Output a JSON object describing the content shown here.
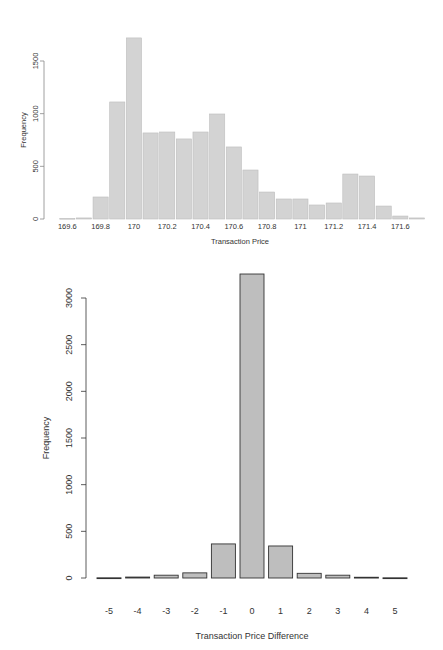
{
  "chart_data": [
    {
      "type": "bar",
      "title": "",
      "xlabel": "Transaction Price",
      "ylabel": "Frequency",
      "categories": [
        "169.6",
        "169.7",
        "169.8",
        "169.9",
        "170",
        "170.1",
        "170.2",
        "170.3",
        "170.4",
        "170.5",
        "170.6",
        "170.7",
        "170.8",
        "170.9",
        "171",
        "171.1",
        "171.2",
        "171.3",
        "171.4",
        "171.5",
        "171.6",
        "171.7"
      ],
      "values": [
        4,
        10,
        209,
        1111,
        1719,
        817,
        826,
        760,
        826,
        997,
        684,
        465,
        256,
        190,
        190,
        133,
        152,
        427,
        408,
        123,
        28,
        10
      ],
      "x_tick_labels": [
        "169.6",
        "169.8",
        "170",
        "170.2",
        "170.4",
        "170.6",
        "170.8",
        "171",
        "171.2",
        "171.4",
        "171.6"
      ],
      "y_ticks": [
        0,
        500,
        1000,
        1500
      ],
      "ylim": [
        0,
        1750
      ],
      "grid": false,
      "bar_color": "#d3d3d3",
      "bar_border": "#bdbdbd"
    },
    {
      "type": "bar",
      "title": "",
      "xlabel": "Transaction Price Difference",
      "ylabel": "Frequency",
      "categories": [
        "-5",
        "-4",
        "-3",
        "-2",
        "-1",
        "0",
        "1",
        "2",
        "3",
        "4",
        "5"
      ],
      "values": [
        2,
        10,
        30,
        55,
        365,
        3257,
        343,
        50,
        30,
        8,
        2
      ],
      "y_ticks": [
        0,
        500,
        1000,
        1500,
        2000,
        2500,
        3000
      ],
      "ylim": [
        0,
        3300
      ],
      "grid": false,
      "bar_color": "#bebebe",
      "bar_border": "#333333"
    }
  ]
}
